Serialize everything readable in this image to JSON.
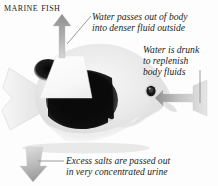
{
  "diagram": {
    "title": "Marine Fish",
    "background_color": "#fdfdfd",
    "text_color": "#201f1f"
  },
  "annotations": {
    "water_out": {
      "id": "water-passes-out",
      "line1": "Water passes out of body",
      "line2": "into denser fluid outside",
      "arrow_direction": "up",
      "arrow_color": "#9a9a9a"
    },
    "water_in": {
      "id": "water-is-drunk",
      "line1": "Water is drunk",
      "line2": "to replenish",
      "line3": "body fluids",
      "arrow_direction": "left",
      "arrow_color": "#a8a8a8"
    },
    "salts_out": {
      "id": "excess-salts",
      "line1": "Excess salts are passed out",
      "line2": "in very concentrated urine",
      "arrow_direction": "down",
      "arrow_color": "#b0b0b0"
    }
  },
  "fish": {
    "name": "marine-fish-photograph",
    "body_color": "#e9e9e9",
    "band_color": "#101010",
    "fin_color": "#efefef",
    "eye_color": "#1a1a1a",
    "highlight_wedge_color": "#fbfbfb"
  }
}
